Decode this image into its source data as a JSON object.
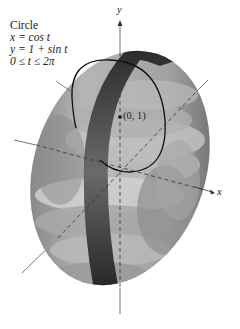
{
  "figure": {
    "caption": {
      "title": "Circle",
      "lines": [
        "x = cos t",
        "y = 1 + sin t",
        "0 ≤ t ≤ 2π"
      ]
    },
    "axes": {
      "y_label": "y",
      "x_label": "x"
    },
    "point_label": "(0, 1)",
    "colors": {
      "surface_light": "#c9c9c9",
      "surface_mid": "#9a9a9a",
      "surface_dark": "#5e5e5e",
      "band": "#3a3a3a",
      "curve": "#111111",
      "axis": "#555555"
    }
  }
}
